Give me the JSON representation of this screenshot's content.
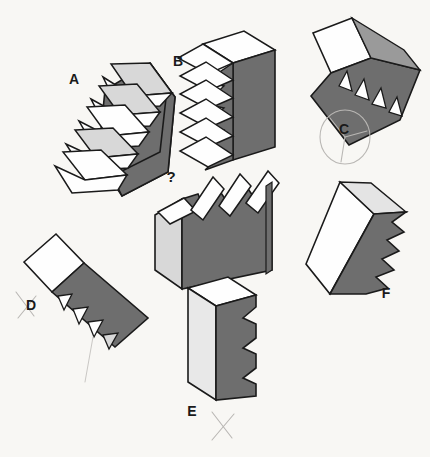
{
  "page": {
    "background_color": "#f8f7f4",
    "width": 430,
    "height": 457
  },
  "palette": {
    "dark_face": "#6e6e6e",
    "mid_face": "#9a9a9a",
    "light_face": "#d8d8d8",
    "white_face": "#fefefe",
    "outline": "#1a1a1a",
    "pencil": "#b9b7b4"
  },
  "question": {
    "marker": "?",
    "name": "question-figure",
    "description": "Unlabeled target figure with sawtooth top edge"
  },
  "figures": [
    {
      "id": "A",
      "label": "A",
      "label_x": 74,
      "label_y": 84,
      "description": "Sawtooth block tilted, five stepped white flaps on left with dark gray body"
    },
    {
      "id": "B",
      "label": "B",
      "label_x": 178,
      "label_y": 66,
      "description": "Upright block with six white zigzag flaps on left and dark gray right face"
    },
    {
      "id": "C",
      "label": "C",
      "label_x": 344,
      "label_y": 134,
      "description": "Rotated flat slab with four triangular sawteeth, label circled in pencil",
      "annotated": true,
      "annotation": "circled"
    },
    {
      "id": "D",
      "label": "D",
      "label_x": 31,
      "label_y": 310,
      "description": "Diagonal slab with four sawteeth pointing left, pencil X beside label",
      "annotated": true,
      "annotation": "x-mark"
    },
    {
      "id": "E",
      "label": "E",
      "label_x": 192,
      "label_y": 416,
      "description": "Upright block with sawtooth right edge, pencil X beside label",
      "annotated": true,
      "annotation": "x-mark"
    },
    {
      "id": "F",
      "label": "F",
      "label_x": 386,
      "label_y": 298,
      "description": "Tilted block with white front face and sawtooth dark right edge"
    }
  ],
  "annotations": [
    {
      "name": "pencil-circle-c",
      "type": "circle",
      "target": "C"
    },
    {
      "name": "pencil-x-d",
      "type": "x-mark",
      "target": "D"
    },
    {
      "name": "pencil-x-e",
      "type": "x-mark",
      "target": "E"
    },
    {
      "name": "pencil-stroke-lower-left",
      "type": "stroke",
      "target": "D"
    }
  ]
}
